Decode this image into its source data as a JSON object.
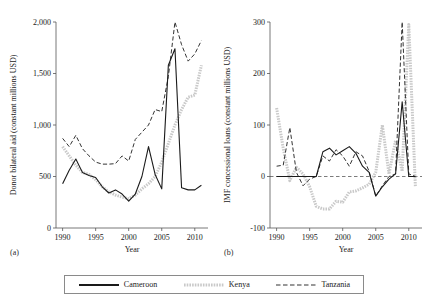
{
  "figure": {
    "panel_a_label": "(a)",
    "panel_b_label": "(b)"
  },
  "legend": {
    "position": "bottom-center",
    "entries": [
      {
        "label": "Cameroon",
        "style": "solid",
        "color": "#1a1a1a",
        "icon": "line-solid-icon"
      },
      {
        "label": "Kenya",
        "style": "dotted-thick",
        "color": "#c9c9c9",
        "icon": "line-dotted-icon"
      },
      {
        "label": "Tanzania",
        "style": "dashed",
        "color": "#333333",
        "icon": "line-dashed-icon"
      }
    ]
  },
  "chart_data": [
    {
      "id": "donor-bilateral-aid",
      "type": "line",
      "title": "Donor bilateral aid",
      "xlabel": "Year",
      "ylabel": "Donor bilateral aid (constant millions USD)",
      "xlim": [
        1989,
        2012
      ],
      "ylim": [
        0,
        2000
      ],
      "xticks": [
        1990,
        1995,
        2000,
        2005,
        2010
      ],
      "xticklabels": [
        "1990",
        "1995",
        "2000",
        "2005",
        "2010"
      ],
      "yticks": [
        0,
        500,
        1000,
        1500,
        2000
      ],
      "yticklabels": [
        "0",
        "500",
        "1,000",
        "1,500",
        "2,000"
      ],
      "grid": false,
      "x": [
        1990,
        1991,
        1992,
        1993,
        1994,
        1995,
        1996,
        1997,
        1998,
        1999,
        2000,
        2001,
        2002,
        2003,
        2004,
        2005,
        2006,
        2007,
        2008,
        2009,
        2010,
        2011
      ],
      "series": [
        {
          "name": "Cameroon",
          "color": "#1a1a1a",
          "style": "solid",
          "values": [
            430,
            560,
            670,
            540,
            510,
            490,
            400,
            340,
            370,
            330,
            260,
            330,
            500,
            790,
            520,
            380,
            1580,
            1740,
            390,
            370,
            370,
            415
          ]
        },
        {
          "name": "Kenya",
          "color": "#c9c9c9",
          "style": "dotted-thick",
          "values": [
            790,
            700,
            610,
            540,
            520,
            470,
            400,
            350,
            320,
            300,
            285,
            320,
            380,
            430,
            500,
            640,
            820,
            1000,
            1150,
            1270,
            1290,
            1580
          ]
        },
        {
          "name": "Tanzania",
          "color": "#333333",
          "style": "dashed",
          "values": [
            870,
            790,
            900,
            770,
            700,
            640,
            620,
            620,
            625,
            700,
            650,
            860,
            930,
            1000,
            1150,
            1130,
            1470,
            2000,
            1780,
            1620,
            1690,
            1820
          ]
        }
      ]
    },
    {
      "id": "imf-concessional-lending",
      "type": "line",
      "title": "IMF concessional leading",
      "xlabel": "Year",
      "ylabel": "IMF concessional loans (constant millions USD)",
      "xlim": [
        1989,
        2012
      ],
      "ylim": [
        -100,
        300
      ],
      "xticks": [
        1990,
        1995,
        2000,
        2005,
        2010
      ],
      "xticklabels": [
        "1990",
        "1995",
        "2000",
        "2005",
        "2010"
      ],
      "yticks": [
        -100,
        0,
        100,
        200,
        300
      ],
      "yticklabels": [
        "-100",
        "0",
        "100",
        "200",
        "300"
      ],
      "grid": false,
      "zero_line": true,
      "x": [
        1990,
        1991,
        1992,
        1993,
        1994,
        1995,
        1996,
        1997,
        1998,
        1999,
        2000,
        2001,
        2002,
        2003,
        2004,
        2005,
        2006,
        2007,
        2008,
        2009,
        2010,
        2011
      ],
      "series": [
        {
          "name": "Cameroon",
          "color": "#1a1a1a",
          "style": "solid",
          "values": [
            0,
            0,
            0,
            0,
            0,
            0,
            0,
            48,
            55,
            42,
            50,
            58,
            45,
            20,
            8,
            -38,
            -20,
            -5,
            5,
            145,
            0,
            0
          ]
        },
        {
          "name": "Kenya",
          "color": "#c9c9c9",
          "style": "dotted-thick",
          "values": [
            133,
            55,
            -8,
            18,
            5,
            -20,
            -58,
            -63,
            -63,
            -48,
            -50,
            -30,
            -28,
            -22,
            -15,
            8,
            100,
            5,
            70,
            10,
            295,
            -20
          ]
        },
        {
          "name": "Tanzania",
          "color": "#333333",
          "style": "dashed",
          "values": [
            20,
            22,
            95,
            8,
            -18,
            -5,
            0,
            40,
            30,
            52,
            40,
            20,
            48,
            40,
            10,
            -38,
            -18,
            0,
            5,
            300,
            5,
            0
          ]
        }
      ]
    }
  ]
}
